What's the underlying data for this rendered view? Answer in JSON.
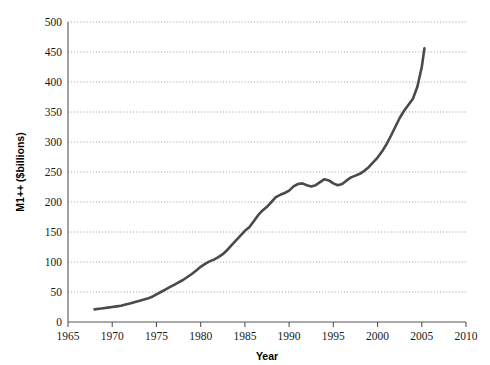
{
  "chart_data": {
    "type": "line",
    "title": "",
    "xlabel": "Year",
    "ylabel": "M1++ ($billions)",
    "xlim": [
      1965,
      2010
    ],
    "ylim": [
      0,
      500
    ],
    "xticks": [
      1965,
      1970,
      1975,
      1980,
      1985,
      1990,
      1995,
      2000,
      2005,
      2010
    ],
    "yticks": [
      0,
      50,
      100,
      150,
      200,
      250,
      300,
      350,
      400,
      450,
      500
    ],
    "grid": "horizontal-dotted",
    "legend": "none",
    "line_color": "#4a4a4a",
    "line_width": 2.6,
    "series": [
      {
        "name": "M1++",
        "x": [
          1968.0,
          1968.5,
          1969.0,
          1969.5,
          1970.0,
          1970.5,
          1971.0,
          1971.5,
          1972.0,
          1972.5,
          1973.0,
          1973.5,
          1974.0,
          1974.5,
          1975.0,
          1975.5,
          1976.0,
          1976.5,
          1977.0,
          1977.5,
          1978.0,
          1978.5,
          1979.0,
          1979.5,
          1980.0,
          1980.5,
          1981.0,
          1981.5,
          1982.0,
          1982.5,
          1983.0,
          1983.5,
          1984.0,
          1984.5,
          1985.0,
          1985.5,
          1986.0,
          1986.5,
          1987.0,
          1987.5,
          1988.0,
          1988.5,
          1989.0,
          1989.5,
          1990.0,
          1990.5,
          1991.0,
          1991.5,
          1992.0,
          1992.5,
          1993.0,
          1993.5,
          1994.0,
          1994.5,
          1995.0,
          1995.5,
          1996.0,
          1996.5,
          1997.0,
          1997.5,
          1998.0,
          1998.5,
          1999.0,
          1999.5,
          2000.0,
          2000.5,
          2001.0,
          2001.5,
          2002.0,
          2002.5,
          2003.0,
          2003.5,
          2004.0,
          2004.5,
          2005.0,
          2005.3
        ],
        "y": [
          21,
          22,
          23,
          24,
          25,
          26,
          27,
          29,
          31,
          33,
          35,
          37,
          39,
          42,
          46,
          50,
          54,
          58,
          62,
          66,
          70,
          75,
          80,
          86,
          92,
          97,
          101,
          104,
          108,
          113,
          120,
          128,
          136,
          144,
          152,
          158,
          168,
          178,
          186,
          192,
          200,
          208,
          212,
          215,
          219,
          226,
          230,
          231,
          228,
          226,
          228,
          233,
          238,
          236,
          231,
          228,
          230,
          236,
          241,
          244,
          247,
          252,
          258,
          266,
          274,
          284,
          296,
          310,
          325,
          340,
          352,
          362,
          372,
          392,
          425,
          456
        ]
      }
    ]
  },
  "axis": {
    "x_tick_labels": [
      "1965",
      "1970",
      "1975",
      "1980",
      "1985",
      "1990",
      "1995",
      "2000",
      "2005",
      "2010"
    ],
    "y_tick_labels": [
      "0",
      "50",
      "100",
      "150",
      "200",
      "250",
      "300",
      "350",
      "400",
      "450",
      "500"
    ],
    "x_title": "Year",
    "y_title": "M1++ ($billions)"
  },
  "colors": {
    "line": "#4a4a4a",
    "axis": "#555555",
    "grid": "#8f8f8f",
    "text": "#1a1a1a",
    "background": "#ffffff"
  }
}
